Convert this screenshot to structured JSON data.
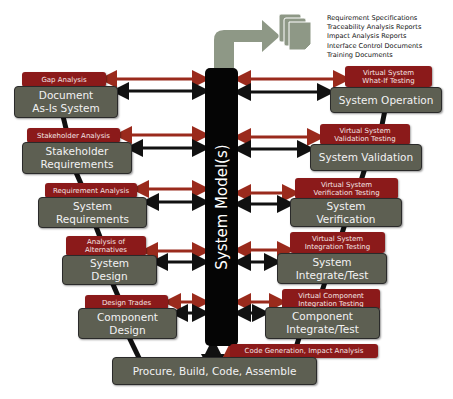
{
  "center": {
    "label": "System Model(s)"
  },
  "outputs": {
    "items": [
      "Requirement Specifications",
      "Traceability Analysis Reports",
      "Impact Analysis Reports",
      "Interface Control Documents",
      "Training Documents"
    ]
  },
  "left": [
    {
      "tag": "Gap Analysis",
      "box": [
        "Document",
        "As-Is System"
      ]
    },
    {
      "tag": "Stakeholder Analysis",
      "box": [
        "Stakeholder",
        "Requirements"
      ]
    },
    {
      "tag": "Requirement Analysis",
      "box": [
        "System",
        "Requirements"
      ]
    },
    {
      "tag": [
        "Analysis of",
        "Alternatives"
      ],
      "box": [
        "System",
        "Design"
      ]
    },
    {
      "tag": "Design Trades",
      "box": [
        "Component",
        "Design"
      ]
    }
  ],
  "right": [
    {
      "tag": [
        "Virtual System",
        "What-If Testing"
      ],
      "box": [
        "System Operation"
      ]
    },
    {
      "tag": [
        "Virtual System",
        "Validation Testing"
      ],
      "box": [
        "System Validation"
      ]
    },
    {
      "tag": [
        "Virtual System",
        "Verification Testing"
      ],
      "box": [
        "System",
        "Verification"
      ]
    },
    {
      "tag": [
        "Virtual System",
        "Integration Testing"
      ],
      "box": [
        "System",
        "Integrate/Test"
      ]
    },
    {
      "tag": [
        "Virtual Component",
        "Integration Testing"
      ],
      "box": [
        "Component",
        "Integrate/Test"
      ]
    }
  ],
  "bottom": {
    "box": "Procure, Build, Code, Assemble",
    "tag": "Code Generation, Impact Analysis"
  },
  "colors": {
    "tag_red": "#8b1a1a",
    "box_gray": "#5d5f52",
    "model_black": "#050505",
    "output_arrow": "#8e9886"
  }
}
